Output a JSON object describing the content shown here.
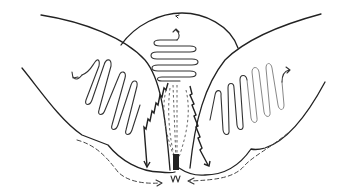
{
  "diagram": {
    "type": "hand-drawn schematic",
    "colors": {
      "background": "#ffffff",
      "ink": "#222222",
      "light_ink": "#888888"
    },
    "elements": {
      "top_lobe": {
        "pattern": "horizontal-zigzag",
        "arrow": "curved-arrow-up"
      },
      "left_lobe": {
        "pattern": "vertical-zigzag",
        "arrow": "curved-arrow-left"
      },
      "right_lobe": {
        "pattern": "vertical-zigzag-fading",
        "arrow": "curved-arrow-right"
      },
      "center": {
        "pattern": "dashed-converging-lines",
        "arrows": [
          "zigzag-arrow-left-down",
          "zigzag-arrow-right-down"
        ]
      },
      "outer_flow": {
        "pattern": "dashed-arrows-inward",
        "count": 2
      }
    },
    "labels": []
  }
}
